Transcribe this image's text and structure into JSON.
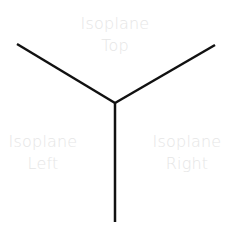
{
  "diagram": {
    "line_color": "#111111",
    "label_color": "#e6e6e6",
    "axes": [
      {
        "name": "left-axis",
        "x1": 17,
        "y1": 44,
        "x2": 115,
        "y2": 103
      },
      {
        "name": "right-axis",
        "x1": 215,
        "y1": 45,
        "x2": 115,
        "y2": 103
      },
      {
        "name": "vertical-axis",
        "x1": 115,
        "y1": 103,
        "x2": 115,
        "y2": 222
      }
    ],
    "labels": {
      "top": {
        "line1": "Isoplane",
        "line2": "Top"
      },
      "left": {
        "line1": "Isoplane",
        "line2": "Left"
      },
      "right": {
        "line1": "Isoplane",
        "line2": "Right"
      }
    }
  }
}
